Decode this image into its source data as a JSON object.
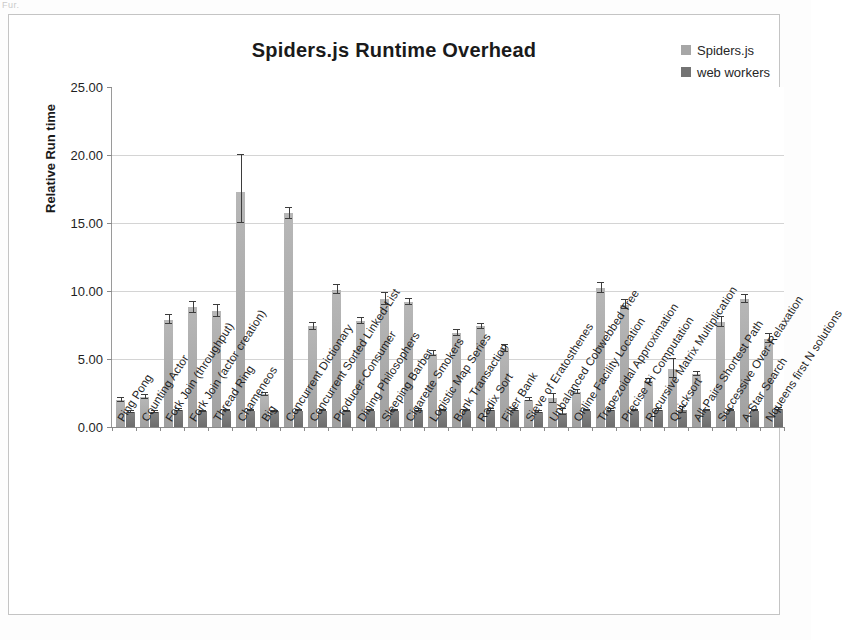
{
  "artifact_text": "Fur.",
  "chart": {
    "title": "Spiders.js Runtime Overhead",
    "y_axis_title": "Relative Run time",
    "legend": [
      {
        "label": "Spiders.js",
        "color": "#a6a6a6"
      },
      {
        "label": "web workers",
        "color": "#737373"
      }
    ],
    "y_ticks": [
      "0.00",
      "5.00",
      "10.00",
      "15.00",
      "20.00",
      "25.00"
    ]
  },
  "chart_data": {
    "type": "bar",
    "title": "Spiders.js Runtime Overhead",
    "xlabel": "",
    "ylabel": "Relative Run time",
    "ylim": [
      0,
      25
    ],
    "ytick_step": 5,
    "grid": true,
    "legend_position": "top-right",
    "error_bars": true,
    "categories": [
      "Ping Pong",
      "Counting Actor",
      "Fork Join (throughput)",
      "Fork Join (actor creation)",
      "Thread Ring",
      "Chameneos",
      "Big",
      "Concurrent Dictionary",
      "Concurrent Sorted Linked-List",
      "Producer-Consumer",
      "Dining Philosophers",
      "Sleeping Barber",
      "Cigarette Smokers",
      "Logistic Map Series",
      "Bank Transaction",
      "Radix Sort",
      "Filter Bank",
      "Sieve of Eratosthenes",
      "Unbalanced Cobwebbed Tree",
      "Online Facility Location",
      "Trapezoidal Approximation",
      "Precise Pi Computation",
      "Recursive Matrix Multiplication",
      "Quicksort",
      "All-Pairs Shortest Path",
      "Successive Over-Relaxation",
      "A-Star Search",
      "Nqueens first N solutions"
    ],
    "series": [
      {
        "name": "Spiders.js",
        "color": "#a6a6a6",
        "values": [
          2.0,
          2.2,
          7.9,
          8.8,
          8.5,
          17.3,
          2.4,
          15.7,
          7.4,
          10.1,
          7.8,
          9.4,
          9.2,
          5.4,
          6.9,
          7.4,
          5.8,
          2.0,
          2.1,
          2.6,
          10.2,
          9.0,
          3.4,
          4.3,
          3.9,
          7.7,
          9.4,
          6.5
        ],
        "err_low": [
          1.85,
          2.05,
          7.55,
          8.4,
          8.1,
          15.0,
          2.3,
          15.3,
          7.15,
          9.8,
          7.55,
          8.95,
          9.0,
          5.25,
          6.7,
          7.2,
          5.55,
          1.9,
          1.75,
          2.45,
          9.85,
          8.7,
          3.25,
          3.6,
          3.75,
          7.35,
          9.1,
          6.2
        ],
        "err_high": [
          2.15,
          2.35,
          8.25,
          9.2,
          8.95,
          20.0,
          2.5,
          16.1,
          7.65,
          10.45,
          8.05,
          9.85,
          9.4,
          5.6,
          7.15,
          7.6,
          6.05,
          2.1,
          2.45,
          2.75,
          10.6,
          9.35,
          3.55,
          5.0,
          4.05,
          8.1,
          9.7,
          6.85
        ]
      },
      {
        "name": "web workers",
        "color": "#737373",
        "values": [
          1.1,
          1.1,
          1.25,
          1.15,
          1.2,
          1.2,
          1.15,
          1.2,
          1.2,
          1.15,
          1.2,
          1.2,
          1.25,
          1.2,
          1.2,
          1.25,
          1.25,
          1.1,
          1.05,
          1.2,
          1.25,
          1.2,
          1.25,
          1.25,
          1.2,
          1.2,
          1.2,
          1.3
        ],
        "err_low": [
          1.05,
          1.05,
          1.18,
          1.1,
          1.15,
          1.15,
          1.1,
          1.15,
          1.15,
          1.1,
          1.15,
          1.15,
          1.18,
          1.15,
          1.15,
          1.18,
          1.18,
          1.05,
          0.9,
          1.15,
          1.18,
          1.15,
          1.18,
          1.0,
          1.15,
          1.15,
          1.15,
          1.22
        ],
        "err_high": [
          1.15,
          1.15,
          1.32,
          1.2,
          1.25,
          1.25,
          1.2,
          1.25,
          1.25,
          1.2,
          1.25,
          1.25,
          1.32,
          1.25,
          1.25,
          1.32,
          1.32,
          1.15,
          1.3,
          1.25,
          1.32,
          1.25,
          1.32,
          1.45,
          1.25,
          1.25,
          1.25,
          1.38
        ]
      }
    ]
  }
}
